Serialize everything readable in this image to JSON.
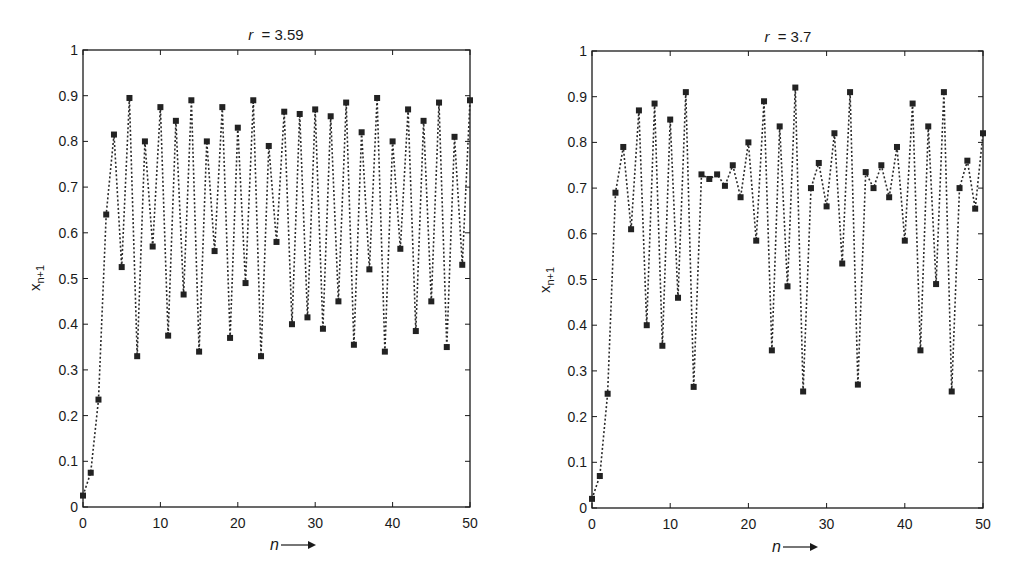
{
  "chart_data": [
    {
      "type": "line",
      "title": "r = 3.59",
      "title_var": "r",
      "title_value": "= 3.59",
      "xlabel": "n",
      "ylabel": "x_{n+1}",
      "xlim": [
        0,
        50
      ],
      "ylim": [
        0,
        1
      ],
      "xticks": [
        0,
        10,
        20,
        30,
        40,
        50
      ],
      "yticks": [
        0,
        0.1,
        0.2,
        0.3,
        0.4,
        0.5,
        0.6,
        0.7,
        0.8,
        0.9,
        1
      ],
      "grid": false,
      "legend": null,
      "marker": "square",
      "line_style": "dotted",
      "series": [
        {
          "name": "x_{n+1}",
          "x": [
            0,
            1,
            2,
            3,
            4,
            5,
            6,
            7,
            8,
            9,
            10,
            11,
            12,
            13,
            14,
            15,
            16,
            17,
            18,
            19,
            20,
            21,
            22,
            23,
            24,
            25,
            26,
            27,
            28,
            29,
            30,
            31,
            32,
            33,
            34,
            35,
            36,
            37,
            38,
            39,
            40,
            41,
            42,
            43,
            44,
            45,
            46,
            47,
            48,
            49,
            50
          ],
          "values": [
            0.025,
            0.075,
            0.235,
            0.64,
            0.815,
            0.525,
            0.895,
            0.33,
            0.8,
            0.57,
            0.875,
            0.375,
            0.845,
            0.465,
            0.89,
            0.34,
            0.8,
            0.56,
            0.875,
            0.37,
            0.83,
            0.49,
            0.89,
            0.33,
            0.79,
            0.58,
            0.865,
            0.4,
            0.86,
            0.415,
            0.87,
            0.39,
            0.855,
            0.45,
            0.885,
            0.355,
            0.82,
            0.52,
            0.895,
            0.34,
            0.8,
            0.565,
            0.87,
            0.385,
            0.845,
            0.45,
            0.885,
            0.35,
            0.81,
            0.53,
            0.89
          ]
        }
      ]
    },
    {
      "type": "line",
      "title": "r = 3.7",
      "title_var": "r",
      "title_value": "= 3.7",
      "xlabel": "n",
      "ylabel": "x_{n+1}",
      "xlim": [
        0,
        50
      ],
      "ylim": [
        0,
        1
      ],
      "xticks": [
        0,
        10,
        20,
        30,
        40,
        50
      ],
      "yticks": [
        0,
        0.1,
        0.2,
        0.3,
        0.4,
        0.5,
        0.6,
        0.7,
        0.8,
        0.9,
        1
      ],
      "grid": false,
      "legend": null,
      "marker": "square",
      "line_style": "dotted",
      "series": [
        {
          "name": "x_{n+1}",
          "x": [
            0,
            1,
            2,
            3,
            4,
            5,
            6,
            7,
            8,
            9,
            10,
            11,
            12,
            13,
            14,
            15,
            16,
            17,
            18,
            19,
            20,
            21,
            22,
            23,
            24,
            25,
            26,
            27,
            28,
            29,
            30,
            31,
            32,
            33,
            34,
            35,
            36,
            37,
            38,
            39,
            40,
            41,
            42,
            43,
            44,
            45,
            46,
            47,
            48,
            49,
            50
          ],
          "values": [
            0.02,
            0.07,
            0.25,
            0.69,
            0.79,
            0.61,
            0.87,
            0.4,
            0.885,
            0.355,
            0.85,
            0.46,
            0.91,
            0.265,
            0.73,
            0.72,
            0.73,
            0.705,
            0.75,
            0.68,
            0.8,
            0.585,
            0.89,
            0.345,
            0.835,
            0.485,
            0.92,
            0.255,
            0.7,
            0.755,
            0.66,
            0.82,
            0.535,
            0.91,
            0.27,
            0.735,
            0.7,
            0.75,
            0.68,
            0.79,
            0.585,
            0.885,
            0.345,
            0.835,
            0.49,
            0.91,
            0.255,
            0.7,
            0.76,
            0.655,
            0.82
          ]
        }
      ]
    }
  ],
  "panels": [
    {
      "title_var": "r",
      "title_value": "= 3.59",
      "xlabel": "n",
      "arrow": "→",
      "ylabel_main": "x",
      "ylabel_sub": "n+1",
      "xtick_labels": [
        "0",
        "10",
        "20",
        "30",
        "40",
        "50"
      ],
      "ytick_labels": [
        "0",
        "0.1",
        "0.2",
        "0.3",
        "0.4",
        "0.5",
        "0.6",
        "0.7",
        "0.8",
        "0.9",
        "1"
      ]
    },
    {
      "title_var": "r",
      "title_value": "= 3.7",
      "xlabel": "n",
      "arrow": "→",
      "ylabel_main": "x",
      "ylabel_sub": "n+1",
      "xtick_labels": [
        "0",
        "10",
        "20",
        "30",
        "40",
        "50"
      ],
      "ytick_labels": [
        "0",
        "0.1",
        "0.2",
        "0.3",
        "0.4",
        "0.5",
        "0.6",
        "0.7",
        "0.8",
        "0.9",
        "1"
      ]
    }
  ]
}
